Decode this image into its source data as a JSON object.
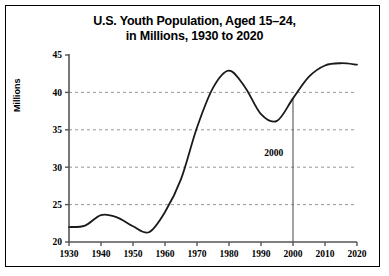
{
  "figure": {
    "title_line1": "U.S. Youth Population, Aged 15–24,",
    "title_line2": "in Millions, 1930 to 2020",
    "border_color": "#000000",
    "background": "#ffffff"
  },
  "chart_data": {
    "type": "line",
    "title": "U.S. Youth Population, Aged 15–24, in Millions, 1930 to 2020",
    "xlabel": "",
    "ylabel": "Millions",
    "xlim": [
      1930,
      2020
    ],
    "ylim": [
      20,
      45
    ],
    "xticks": [
      1930,
      1940,
      1950,
      1960,
      1970,
      1980,
      1990,
      2000,
      2010,
      2020
    ],
    "yticks": [
      20,
      25,
      30,
      35,
      40,
      45
    ],
    "xtick_labels": [
      "1930",
      "1940",
      "1950",
      "1960",
      "1970",
      "1980",
      "1990",
      "2000",
      "2010",
      "2020"
    ],
    "ytick_labels": [
      "20",
      "25",
      "30",
      "35",
      "40",
      "45"
    ],
    "grid": "horizontal-dashed",
    "legend": "none",
    "line_color": "#1a1a1a",
    "line_width": 1.8,
    "annotations": [
      {
        "label": "2000",
        "x": 2000,
        "type": "vertical-line",
        "line_color": "#555555",
        "label_x": 1994,
        "label_y": 31.5
      }
    ],
    "x": [
      1930,
      1935,
      1940,
      1945,
      1950,
      1955,
      1960,
      1965,
      1970,
      1975,
      1980,
      1985,
      1990,
      1995,
      2000,
      2005,
      2010,
      2015,
      2020
    ],
    "values": [
      22.0,
      22.2,
      23.6,
      23.3,
      22.1,
      21.3,
      24.0,
      28.4,
      35.3,
      40.6,
      42.9,
      40.7,
      37.1,
      36.2,
      39.2,
      42.1,
      43.6,
      43.9,
      43.7
    ],
    "series": [
      {
        "name": "U.S. Youth Population Aged 15-24 (millions)",
        "values": [
          22.0,
          22.2,
          23.6,
          23.3,
          22.1,
          21.3,
          24.0,
          28.4,
          35.3,
          40.6,
          42.9,
          40.7,
          37.1,
          36.2,
          39.2,
          42.1,
          43.6,
          43.9,
          43.7
        ]
      }
    ]
  }
}
